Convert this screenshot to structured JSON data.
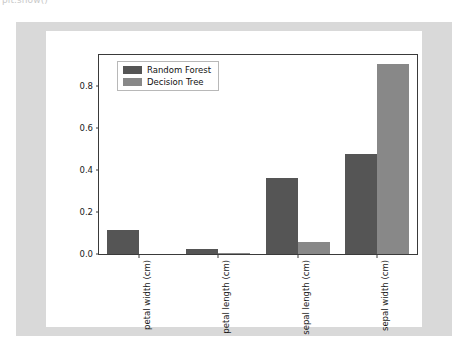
{
  "notebook": {
    "cell_label": "plt.show()"
  },
  "colors": {
    "panel_background": "#d9d9d9",
    "figure_background": "#ffffff",
    "axes_edge": "#3a3a3a",
    "random_forest": "#555555",
    "decision_tree": "#888888",
    "tick_text": "#1a1a1a",
    "legend_border": "#b8b8b8"
  },
  "chart_data": {
    "type": "bar",
    "title": "",
    "xlabel": "",
    "ylabel": "",
    "categories": [
      "petal width (cm)",
      "petal length (cm)",
      "sepal length (cm)",
      "sepal width (cm)"
    ],
    "series": [
      {
        "name": "Random Forest",
        "color": "#555555",
        "values": [
          0.115,
          0.022,
          0.362,
          0.478
        ]
      },
      {
        "name": "Decision Tree",
        "color": "#888888",
        "values": [
          0.0,
          0.006,
          0.055,
          0.905
        ]
      }
    ],
    "ylim": [
      0.0,
      0.95
    ],
    "yticks": [
      0.0,
      0.2,
      0.4,
      0.6,
      0.8
    ],
    "ytick_labels": [
      "0.0",
      "0.2",
      "0.4",
      "0.6",
      "0.8"
    ],
    "grid": false,
    "legend_position": "upper left",
    "xtick_rotation": 90
  },
  "legend": {
    "entries": [
      {
        "label": "Random Forest"
      },
      {
        "label": "Decision Tree"
      }
    ]
  }
}
